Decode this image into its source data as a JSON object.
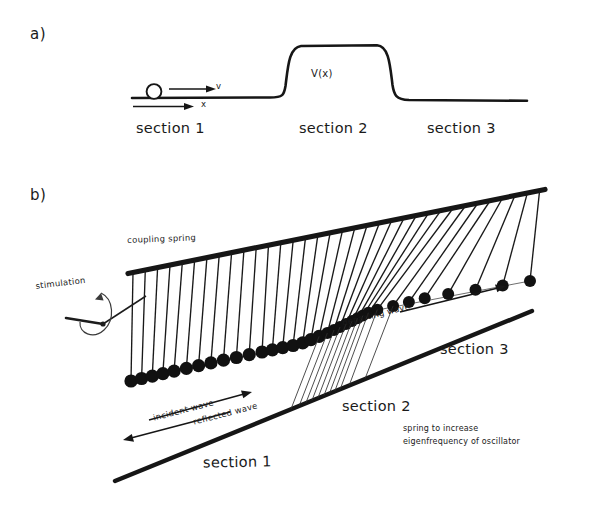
{
  "figure": {
    "type": "physics-schematic",
    "background": "#ffffff",
    "ink_color": "#1a1a1a",
    "width": 592,
    "height": 515
  },
  "panel_a": {
    "tag": "a)",
    "potential_label": "V(x)",
    "velocity_label": "v",
    "axis_label": "x",
    "particle": "circle-ball",
    "sections": [
      {
        "label": "section 1"
      },
      {
        "label": "section 2"
      },
      {
        "label": "section 3"
      }
    ]
  },
  "panel_b": {
    "tag": "b)",
    "annotations": {
      "coupling_spring": "coupling spring",
      "stimulation": "stimulation",
      "incident_wave": "incident wave",
      "reflected_wave": "reflected wave",
      "departing_wave": "departing wave",
      "extra_spring_line1": "spring to increase",
      "extra_spring_line2": "eigenfrequency of oscillator"
    },
    "sections": [
      {
        "label": "section 1"
      },
      {
        "label": "section 2"
      },
      {
        "label": "section 3"
      }
    ],
    "oscillator_count": 34,
    "section2_spring_count": 11
  },
  "chart_data": {
    "type": "line",
    "title": "",
    "xlabel": "x",
    "ylabel": "V(x)",
    "grid": false,
    "legend": null,
    "series": [
      {
        "name": "V(x) potential barrier",
        "x": [
          0,
          0.4,
          0.44,
          0.48,
          0.5,
          0.74,
          0.76,
          0.8,
          0.84,
          1.0
        ],
        "y": [
          0.0,
          0.0,
          0.15,
          0.85,
          1.0,
          1.0,
          0.85,
          0.15,
          0.0,
          0.0
        ],
        "description": "flat-topped rectangular potential barrier with rounded shoulders"
      }
    ],
    "xlim": [
      0,
      1
    ],
    "ylim": [
      0,
      1.15
    ],
    "annotations": [
      {
        "text": "V(x)",
        "x": 0.56,
        "y": 0.42
      },
      {
        "text": "v",
        "x": 0.3,
        "y": 0.1
      },
      {
        "text": "x",
        "x": 0.26,
        "y": -0.1
      },
      {
        "text": "section 1",
        "x": 0.17,
        "y": -0.3
      },
      {
        "text": "section 2",
        "x": 0.58,
        "y": -0.3
      },
      {
        "text": "section 3",
        "x": 0.84,
        "y": -0.3
      }
    ]
  }
}
